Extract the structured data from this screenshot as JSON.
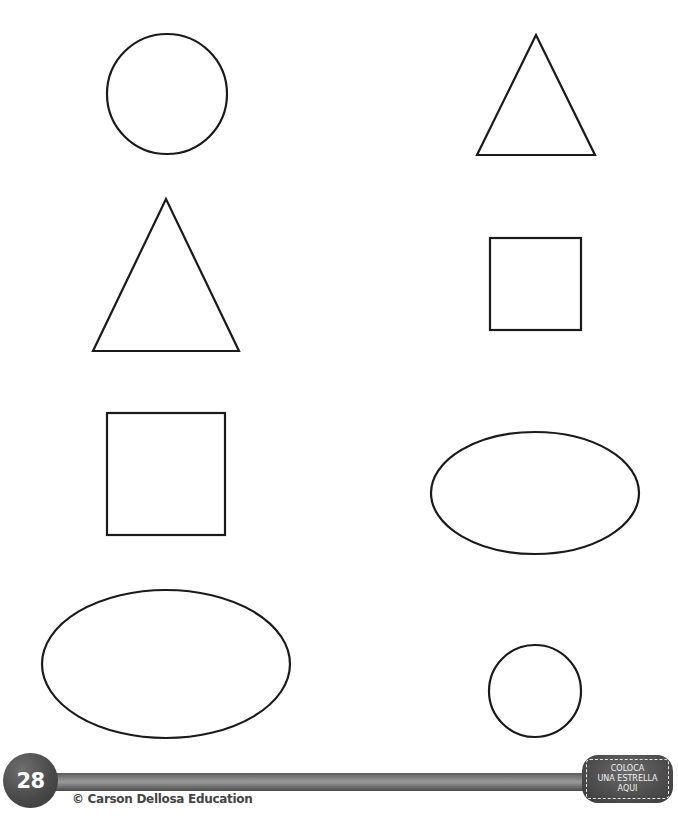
{
  "worksheet": {
    "shapes": [
      {
        "id": "circle-large",
        "type": "circle",
        "cx": 167,
        "cy": 94,
        "r": 60
      },
      {
        "id": "triangle-small",
        "type": "triangle",
        "points": "536,35 477,155 595,155"
      },
      {
        "id": "triangle-large",
        "type": "triangle",
        "points": "166,199 93,351 239,351"
      },
      {
        "id": "square-small",
        "type": "square",
        "x": 490,
        "y": 238,
        "w": 91,
        "h": 92
      },
      {
        "id": "square-large",
        "type": "square",
        "x": 107,
        "y": 413,
        "w": 118,
        "h": 122
      },
      {
        "id": "oval-small",
        "type": "oval",
        "cx": 535,
        "cy": 493,
        "rx": 104,
        "ry": 61
      },
      {
        "id": "oval-large",
        "type": "oval",
        "cx": 166,
        "cy": 664,
        "rx": 124,
        "ry": 74
      },
      {
        "id": "circle-small",
        "type": "circle",
        "cx": 535,
        "cy": 691,
        "r": 46
      }
    ],
    "stroke_color": "#1a1a1a",
    "stroke_width": 2.2
  },
  "footer": {
    "page_number": "28",
    "copyright": "© Carson Dellosa Education",
    "star_box": {
      "line1": "COLOCA",
      "line2": "UNA ESTRELLA",
      "line3": "AQUI"
    }
  }
}
